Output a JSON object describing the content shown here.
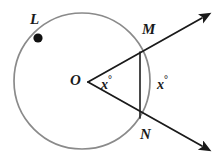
{
  "figure": {
    "type": "geometry-diagram",
    "background_color": "#ffffff",
    "circle_color": "#8a8a8a",
    "line_color": "#1a1a1a",
    "text_color": "#1a1a1a"
  },
  "circle": {
    "center_x": 82,
    "center_y": 81,
    "radius": 68,
    "stroke_width": 1.6
  },
  "points": {
    "L": {
      "label": "L",
      "x": 38,
      "y": 38,
      "dot_radius": 4.5,
      "on_circle": true
    },
    "O": {
      "label": "O",
      "x": 88,
      "y": 82,
      "dot_radius": 0,
      "on_circle": false
    },
    "M": {
      "label": "M",
      "x": 140,
      "y": 52,
      "dot_radius": 0,
      "on_circle": true
    },
    "N": {
      "label": "N",
      "x": 140,
      "y": 118,
      "dot_radius": 0,
      "on_circle": true
    }
  },
  "rays": [
    {
      "name": "ray-OM",
      "from": "O",
      "through": "M",
      "end_x": 206,
      "end_y": 14,
      "arrowhead": true
    },
    {
      "name": "ray-ON",
      "from": "O",
      "through": "N",
      "end_x": 206,
      "end_y": 150,
      "arrowhead": true
    }
  ],
  "chord": {
    "name": "chord-MN",
    "from": "M",
    "to": "N"
  },
  "angles": {
    "inner": {
      "label": "x",
      "degree_symbol": "°",
      "position": "between ray OM and ray ON at vertex O"
    },
    "outer": {
      "label": "x",
      "degree_symbol": "°",
      "position": "right of chord MN, arc region"
    }
  }
}
